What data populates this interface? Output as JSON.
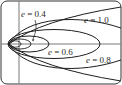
{
  "figure": {
    "labels": [
      {
        "id": "e04",
        "var": "e",
        "eq": " = ",
        "value": "0.4"
      },
      {
        "id": "e10",
        "var": "e",
        "eq": " = ",
        "value": "1.0"
      },
      {
        "id": "e06",
        "var": "e",
        "eq": " = ",
        "value": "0.6"
      },
      {
        "id": "e08",
        "var": "e",
        "eq": " = ",
        "value": "0.8"
      }
    ],
    "colors": {
      "stroke": "#1e1e1e",
      "axis": "#555555",
      "frame": "#333333",
      "background": "#ffffff"
    }
  }
}
